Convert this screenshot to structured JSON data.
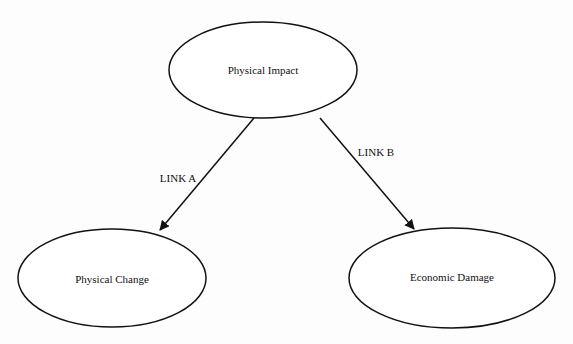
{
  "diagram": {
    "type": "directed-graph",
    "nodes": [
      {
        "id": "physical_impact",
        "label": "Physical Impact",
        "shape": "ellipse",
        "cx": 263,
        "cy": 70,
        "rx": 94,
        "ry": 48
      },
      {
        "id": "physical_change",
        "label": "Physical Change",
        "shape": "ellipse",
        "cx": 112,
        "cy": 278,
        "rx": 94,
        "ry": 49
      },
      {
        "id": "economic_damage",
        "label": "Economic Damage",
        "shape": "ellipse",
        "cx": 452,
        "cy": 278,
        "rx": 103,
        "ry": 50
      }
    ],
    "edges": [
      {
        "id": "link_a",
        "from": "physical_impact",
        "to": "physical_change",
        "label": "LINK A"
      },
      {
        "id": "link_b",
        "from": "physical_impact",
        "to": "economic_damage",
        "label": "LINK B"
      }
    ],
    "colors": {
      "stroke": "#111111",
      "fill": "#ffffff",
      "text": "#111111"
    }
  }
}
